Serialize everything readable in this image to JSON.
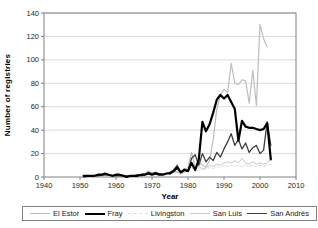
{
  "chart_data": {
    "type": "line",
    "title": "",
    "xlabel": "Year",
    "ylabel": "Number of registries",
    "xlim": [
      1940,
      2010
    ],
    "ylim": [
      0,
      140
    ],
    "xticks": [
      1940,
      1950,
      1960,
      1970,
      1980,
      1990,
      2000,
      2010
    ],
    "yticks": [
      0,
      20,
      40,
      60,
      80,
      100,
      120,
      140
    ],
    "grid": "horizontal",
    "legend_position": "bottom",
    "colors": {
      "plot_border": "#808080",
      "gridline": "#dcdcdc",
      "tick_text": "#262626"
    },
    "draw_order": [
      2,
      3,
      0,
      4,
      1
    ],
    "series": [
      {
        "name": "El Estor",
        "color": "#bdbdbd",
        "width": 1.2,
        "dash": "",
        "points": [
          [
            1951,
            0
          ],
          [
            1953,
            1
          ],
          [
            1955,
            0
          ],
          [
            1957,
            1
          ],
          [
            1959,
            1
          ],
          [
            1961,
            2
          ],
          [
            1963,
            1
          ],
          [
            1965,
            1
          ],
          [
            1967,
            2
          ],
          [
            1968,
            3
          ],
          [
            1969,
            5
          ],
          [
            1970,
            3
          ],
          [
            1971,
            4
          ],
          [
            1972,
            2
          ],
          [
            1973,
            3
          ],
          [
            1974,
            3
          ],
          [
            1975,
            4
          ],
          [
            1976,
            5
          ],
          [
            1977,
            4
          ],
          [
            1978,
            3
          ],
          [
            1979,
            5
          ],
          [
            1980,
            8
          ],
          [
            1981,
            21
          ],
          [
            1982,
            8
          ],
          [
            1983,
            13
          ],
          [
            1984,
            10
          ],
          [
            1985,
            9
          ],
          [
            1986,
            14
          ],
          [
            1987,
            32
          ],
          [
            1988,
            58
          ],
          [
            1989,
            70
          ],
          [
            1990,
            75
          ],
          [
            1991,
            72
          ],
          [
            1992,
            97
          ],
          [
            1993,
            80
          ],
          [
            1994,
            79
          ],
          [
            1995,
            83
          ],
          [
            1996,
            82
          ],
          [
            1997,
            63
          ],
          [
            1998,
            91
          ],
          [
            1999,
            61
          ],
          [
            2000,
            130
          ],
          [
            2001,
            118
          ],
          [
            2002,
            111
          ]
        ]
      },
      {
        "name": "Fray",
        "color": "#000000",
        "width": 2.2,
        "dash": "",
        "points": [
          [
            1951,
            1
          ],
          [
            1952,
            1
          ],
          [
            1953,
            1
          ],
          [
            1954,
            1
          ],
          [
            1955,
            2
          ],
          [
            1956,
            2
          ],
          [
            1957,
            3
          ],
          [
            1958,
            2
          ],
          [
            1959,
            1
          ],
          [
            1960,
            2
          ],
          [
            1961,
            2
          ],
          [
            1962,
            1
          ],
          [
            1963,
            0
          ],
          [
            1964,
            1
          ],
          [
            1965,
            1
          ],
          [
            1966,
            1
          ],
          [
            1967,
            2
          ],
          [
            1968,
            2
          ],
          [
            1969,
            3
          ],
          [
            1970,
            2
          ],
          [
            1971,
            3
          ],
          [
            1972,
            2
          ],
          [
            1973,
            2
          ],
          [
            1974,
            3
          ],
          [
            1975,
            3
          ],
          [
            1976,
            5
          ],
          [
            1977,
            8
          ],
          [
            1978,
            4
          ],
          [
            1979,
            6
          ],
          [
            1980,
            5
          ],
          [
            1981,
            12
          ],
          [
            1982,
            6
          ],
          [
            1983,
            15
          ],
          [
            1984,
            47
          ],
          [
            1985,
            39
          ],
          [
            1986,
            45
          ],
          [
            1987,
            55
          ],
          [
            1988,
            66
          ],
          [
            1989,
            70
          ],
          [
            1990,
            67
          ],
          [
            1991,
            70
          ],
          [
            1992,
            64
          ],
          [
            1993,
            58
          ],
          [
            1994,
            31
          ],
          [
            1995,
            48
          ],
          [
            1996,
            43
          ],
          [
            1997,
            42
          ],
          [
            1998,
            42
          ],
          [
            1999,
            41
          ],
          [
            2000,
            40
          ],
          [
            2001,
            41
          ],
          [
            2002,
            46
          ],
          [
            2003,
            15
          ]
        ]
      },
      {
        "name": "Livingston",
        "color": "#dedede",
        "width": 1,
        "dash": "3,2",
        "points": [
          [
            1951,
            0
          ],
          [
            1955,
            0
          ],
          [
            1959,
            1
          ],
          [
            1961,
            1
          ],
          [
            1963,
            0
          ],
          [
            1965,
            1
          ],
          [
            1967,
            1
          ],
          [
            1968,
            2
          ],
          [
            1969,
            5
          ],
          [
            1970,
            2
          ],
          [
            1971,
            4
          ],
          [
            1972,
            2
          ],
          [
            1973,
            3
          ],
          [
            1974,
            2
          ],
          [
            1975,
            3
          ],
          [
            1976,
            4
          ],
          [
            1977,
            3
          ],
          [
            1978,
            2
          ],
          [
            1979,
            4
          ],
          [
            1980,
            5
          ],
          [
            1981,
            8
          ],
          [
            1982,
            5
          ],
          [
            1983,
            7
          ],
          [
            1984,
            6
          ],
          [
            1985,
            7
          ],
          [
            1986,
            8
          ],
          [
            1987,
            7
          ],
          [
            1988,
            9
          ],
          [
            1989,
            8
          ],
          [
            1990,
            10
          ],
          [
            1991,
            9
          ],
          [
            1992,
            10
          ],
          [
            1993,
            9
          ],
          [
            1994,
            10
          ],
          [
            1995,
            9
          ],
          [
            1996,
            10
          ],
          [
            1997,
            9
          ],
          [
            1998,
            10
          ],
          [
            1999,
            9
          ],
          [
            2000,
            10
          ],
          [
            2001,
            9
          ],
          [
            2002,
            10
          ],
          [
            2003,
            11
          ]
        ]
      },
      {
        "name": "San Luis",
        "color": "#c9c9c9",
        "width": 1,
        "dash": "",
        "points": [
          [
            1951,
            0
          ],
          [
            1955,
            1
          ],
          [
            1959,
            1
          ],
          [
            1961,
            2
          ],
          [
            1963,
            1
          ],
          [
            1965,
            1
          ],
          [
            1967,
            2
          ],
          [
            1969,
            4
          ],
          [
            1971,
            3
          ],
          [
            1973,
            3
          ],
          [
            1975,
            3
          ],
          [
            1977,
            5
          ],
          [
            1979,
            4
          ],
          [
            1980,
            6
          ],
          [
            1981,
            10
          ],
          [
            1982,
            6
          ],
          [
            1983,
            9
          ],
          [
            1984,
            7
          ],
          [
            1985,
            8
          ],
          [
            1986,
            10
          ],
          [
            1987,
            9
          ],
          [
            1988,
            11
          ],
          [
            1989,
            10
          ],
          [
            1990,
            12
          ],
          [
            1991,
            13
          ],
          [
            1992,
            12
          ],
          [
            1993,
            14
          ],
          [
            1994,
            12
          ],
          [
            1995,
            16
          ],
          [
            1996,
            12
          ],
          [
            1997,
            11
          ],
          [
            1998,
            13
          ],
          [
            1999,
            11
          ],
          [
            2000,
            12
          ],
          [
            2001,
            11
          ],
          [
            2002,
            12
          ],
          [
            2003,
            15
          ]
        ]
      },
      {
        "name": "San Andrés",
        "color": "#3d3d3d",
        "width": 1.3,
        "dash": "",
        "points": [
          [
            1951,
            0
          ],
          [
            1953,
            1
          ],
          [
            1955,
            1
          ],
          [
            1957,
            2
          ],
          [
            1959,
            1
          ],
          [
            1961,
            1
          ],
          [
            1963,
            1
          ],
          [
            1965,
            1
          ],
          [
            1966,
            2
          ],
          [
            1967,
            1
          ],
          [
            1968,
            2
          ],
          [
            1969,
            4
          ],
          [
            1970,
            3
          ],
          [
            1971,
            4
          ],
          [
            1972,
            3
          ],
          [
            1973,
            2
          ],
          [
            1974,
            3
          ],
          [
            1975,
            4
          ],
          [
            1976,
            6
          ],
          [
            1977,
            10
          ],
          [
            1978,
            4
          ],
          [
            1979,
            7
          ],
          [
            1980,
            5
          ],
          [
            1981,
            16
          ],
          [
            1982,
            19
          ],
          [
            1983,
            10
          ],
          [
            1984,
            20
          ],
          [
            1985,
            13
          ],
          [
            1986,
            17
          ],
          [
            1987,
            14
          ],
          [
            1988,
            21
          ],
          [
            1989,
            17
          ],
          [
            1990,
            24
          ],
          [
            1991,
            30
          ],
          [
            1992,
            37
          ],
          [
            1993,
            27
          ],
          [
            1994,
            32
          ],
          [
            1995,
            24
          ],
          [
            1996,
            29
          ],
          [
            1997,
            21
          ],
          [
            1998,
            25
          ],
          [
            1999,
            27
          ],
          [
            2000,
            20
          ],
          [
            2001,
            23
          ],
          [
            2002,
            47
          ],
          [
            2003,
            27
          ]
        ]
      }
    ]
  }
}
